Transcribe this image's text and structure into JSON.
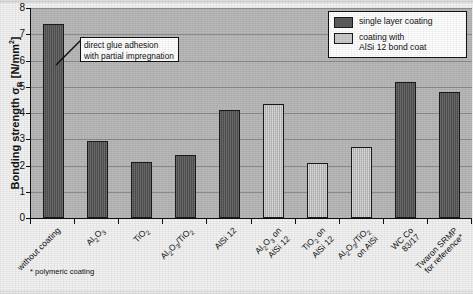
{
  "chart_data": {
    "type": "bar",
    "title": "",
    "xlabel": "",
    "ylabel": "Bonding strength σB [N/mm²]",
    "ylim": [
      0,
      8
    ],
    "ytick_values": [
      0,
      1,
      2,
      3,
      4,
      5,
      6,
      7,
      8
    ],
    "ytick_labels": [
      "0",
      "1",
      "2",
      "3",
      "4",
      "5",
      "6",
      "7",
      "8"
    ],
    "grid": true,
    "legend_position": "top-right",
    "categories": [
      "without coating",
      "Al2O3",
      "TiO2",
      "Al2O3/TiO2",
      "AlSi 12",
      "Al2O3 on AlSi 12",
      "TiO2 on AlSi 12",
      "Al2O3/TiO2 on AlSi",
      "WC Co 83/17",
      "Twaron SRMP for reference*"
    ],
    "values": [
      7.4,
      2.95,
      2.15,
      2.4,
      4.1,
      4.35,
      2.1,
      2.7,
      5.2,
      4.8
    ],
    "series_of_bar": [
      "single layer coating",
      "single layer coating",
      "single layer coating",
      "single layer coating",
      "single layer coating",
      "coating with AlSi 12 bond coat",
      "coating with AlSi 12 bond coat",
      "coating with AlSi 12 bond coat",
      "single layer coating",
      "single layer coating"
    ],
    "series": [
      {
        "name": "single layer coating",
        "values": [
          7.4,
          2.95,
          2.15,
          2.4,
          4.1,
          null,
          null,
          null,
          5.2,
          4.8
        ]
      },
      {
        "name": "coating with AlSi 12 bond coat",
        "values": [
          null,
          null,
          null,
          null,
          null,
          4.35,
          2.1,
          2.7,
          null,
          null
        ]
      }
    ],
    "annotations": [
      {
        "text": "direct glue adhesion with partial impregnation",
        "points_to": "without coating"
      }
    ],
    "footnote": "* polymeric coating"
  },
  "axis": {
    "y_title_main": "Bonding strength ",
    "y_title_sigma": "σ",
    "y_title_sub": "B",
    "y_title_unit": " [N/mm",
    "y_title_sup": "2",
    "y_title_close": "]"
  },
  "xlabels": [
    {
      "line1": "without coating",
      "line2": ""
    },
    {
      "line1": "Al",
      "sub1": "2",
      "mid1": "O",
      "sub2": "3",
      "line2": ""
    },
    {
      "line1": "TiO",
      "sub1": "2",
      "line2": ""
    },
    {
      "line1": "Al",
      "sub1": "2",
      "mid1": "O",
      "sub2": "3",
      "mid2": "/TiO",
      "sub3": "2",
      "line2": ""
    },
    {
      "line1": "AlSi 12",
      "line2": ""
    },
    {
      "line1": "Al",
      "sub1": "2",
      "mid1": "O",
      "sub2": "3",
      "mid2": " on",
      "line2": "AlSi 12"
    },
    {
      "line1": "TiO",
      "sub1": "2",
      "mid1": " on",
      "line2": "AlSi 12"
    },
    {
      "line1": "Al",
      "sub1": "2",
      "mid1": "O",
      "sub2": "3",
      "mid2": "/TiO",
      "sub3": "2",
      "line2": "on AlSi"
    },
    {
      "line1": "WC Co",
      "line2": "83/17"
    },
    {
      "line1": "Twaron SRMP",
      "line2": "for reference*"
    }
  ],
  "legend": {
    "items": [
      {
        "label": "single layer coating",
        "label2": "",
        "swatch": "dark",
        "color": "#5b5b5b"
      },
      {
        "label": "coating with",
        "label2": "AlSi 12 bond coat",
        "swatch": "light",
        "color": "#cccccc"
      }
    ]
  },
  "callout": {
    "line1": "direct glue adhesion",
    "line2": "with partial impregnation"
  },
  "footnote": {
    "text": "* polymeric coating"
  },
  "colors": {
    "plot_background": "#b9b9b9",
    "bar_dark": "#5b5b5b",
    "bar_light": "#c9c9c9",
    "gridline": "#8c8c8c",
    "axis": "#111111"
  }
}
